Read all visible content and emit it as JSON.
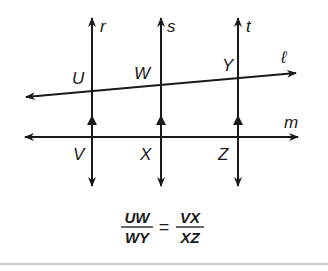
{
  "diagram": {
    "lines": {
      "r": "r",
      "s": "s",
      "t": "t",
      "l": "ℓ",
      "m": "m"
    },
    "points": {
      "U": "U",
      "W": "W",
      "Y": "Y",
      "V": "V",
      "X": "X",
      "Z": "Z"
    },
    "formula": {
      "left_num": "UW",
      "left_den": "WY",
      "equals": "=",
      "right_num": "VX",
      "right_den": "XZ"
    },
    "colors": {
      "stroke": "#1a1a1a",
      "background": "#ffffff",
      "rule": "#bdbdbd"
    }
  }
}
